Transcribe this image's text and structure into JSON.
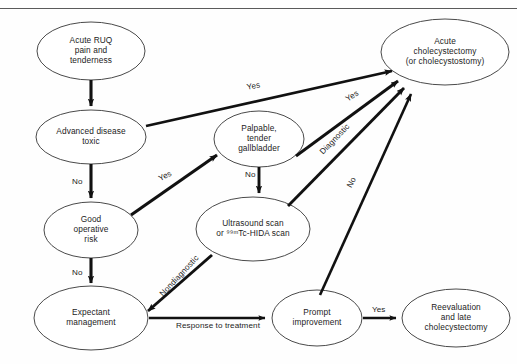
{
  "figure": {
    "type": "flowchart",
    "background_color": "#fefefe",
    "node_stroke_color": "#4a4a4a",
    "arrow_color": "#111111",
    "text_color": "#1c1c1c"
  },
  "nodes": [
    {
      "id": "acute-ruq",
      "name": "acute-ruq-pain-node",
      "lines": [
        "Acute RUQ",
        "pain and",
        "tenderness"
      ],
      "cx": 91,
      "cy": 51,
      "rx": 54,
      "ry": 29
    },
    {
      "id": "advanced-disease",
      "name": "advanced-disease-node",
      "lines": [
        "Advanced disease",
        "toxic"
      ],
      "cx": 91,
      "cy": 137,
      "rx": 55,
      "ry": 27
    },
    {
      "id": "good-operative-risk",
      "name": "good-operative-risk-node",
      "lines": [
        "Good",
        "operative",
        "risk"
      ],
      "cx": 91,
      "cy": 230,
      "rx": 47,
      "ry": 28
    },
    {
      "id": "expectant-management",
      "name": "expectant-management-node",
      "lines": [
        "Expectant",
        "management"
      ],
      "cx": 91,
      "cy": 318,
      "rx": 57,
      "ry": 32
    },
    {
      "id": "palpable-gallbladder",
      "name": "palpable-tender-gallbladder-node",
      "lines": [
        "Palpable,",
        "tender",
        "gallbladder"
      ],
      "cx": 259,
      "cy": 139,
      "rx": 45,
      "ry": 28
    },
    {
      "id": "ultrasound-scan",
      "name": "ultrasound-scan-node",
      "lines": [
        "Ultrasound scan",
        "or ⁹⁹ᵐTc-HIDA scan"
      ],
      "cx": 253,
      "cy": 229,
      "rx": 57,
      "ry": 32
    },
    {
      "id": "prompt-improvement",
      "name": "prompt-improvement-node",
      "lines": [
        "Prompt",
        "improvement"
      ],
      "cx": 317,
      "cy": 318,
      "rx": 45,
      "ry": 28
    },
    {
      "id": "acute-cholecystectomy",
      "name": "acute-cholecystectomy-node",
      "lines": [
        "Acute",
        "cholecystectomy",
        "(or cholecystostomy)"
      ],
      "cx": 445,
      "cy": 52,
      "rx": 64,
      "ry": 33
    },
    {
      "id": "reevaluation-late",
      "name": "reevaluation-late-cholecystectomy-node",
      "lines": [
        "Reevaluation",
        "and late",
        "cholecystectomy"
      ],
      "cx": 456,
      "cy": 318,
      "rx": 54,
      "ry": 29
    }
  ],
  "edges": [
    {
      "id": "e1",
      "name": "edge-acute-ruq-to-advanced-disease",
      "from": "acute-ruq",
      "to": "advanced-disease",
      "label": "",
      "weight": "thick"
    },
    {
      "id": "e2",
      "name": "edge-advanced-disease-yes-to-cholecystectomy",
      "from": "advanced-disease",
      "to": "acute-cholecystectomy",
      "label": "Yes",
      "label_x": 246,
      "label_y": 83,
      "label_rot": -11,
      "weight": "thick"
    },
    {
      "id": "e3",
      "name": "edge-advanced-disease-no-to-good-risk",
      "from": "advanced-disease",
      "to": "good-operative-risk",
      "label": "No",
      "label_x": 72,
      "label_y": 177,
      "label_rot": 0,
      "weight": "thick"
    },
    {
      "id": "e4",
      "name": "edge-good-risk-yes-to-palpable",
      "from": "good-operative-risk",
      "to": "palpable-gallbladder",
      "label": "Yes",
      "label_x": 157,
      "label_y": 175,
      "label_rot": -27,
      "weight": "thick"
    },
    {
      "id": "e5",
      "name": "edge-good-risk-no-to-expectant",
      "from": "good-operative-risk",
      "to": "expectant-management",
      "label": "No",
      "label_x": 72,
      "label_y": 268,
      "label_rot": 0,
      "weight": "thick"
    },
    {
      "id": "e6",
      "name": "edge-palpable-yes-to-cholecystectomy",
      "from": "palpable-gallbladder",
      "to": "acute-cholecystectomy",
      "label": "Yes",
      "label_x": 344,
      "label_y": 96,
      "label_rot": -33,
      "weight": "thick"
    },
    {
      "id": "e7",
      "name": "edge-palpable-no-to-ultrasound",
      "from": "palpable-gallbladder",
      "to": "ultrasound-scan",
      "label": "No",
      "label_x": 245,
      "label_y": 170,
      "label_rot": 0,
      "weight": "thick"
    },
    {
      "id": "e8",
      "name": "edge-ultrasound-diagnostic-to-cholecystectomy",
      "from": "ultrasound-scan",
      "to": "acute-cholecystectomy",
      "label": "Diagnostic",
      "label_x": 318,
      "label_y": 150,
      "label_rot": -46,
      "weight": "thick"
    },
    {
      "id": "e9",
      "name": "edge-ultrasound-nondiagnostic-to-expectant",
      "from": "ultrasound-scan",
      "to": "expectant-management",
      "label": "Nondiagnostic",
      "label_x": 158,
      "label_y": 292,
      "label_rot": -47,
      "weight": "thick"
    },
    {
      "id": "e10",
      "name": "edge-expectant-response-to-prompt-improvement",
      "from": "expectant-management",
      "to": "prompt-improvement",
      "label": "Response\nto treatment",
      "label_x": 209,
      "label_y": 322,
      "label_rot": 0,
      "weight": "medium"
    },
    {
      "id": "e11",
      "name": "edge-prompt-improvement-no-to-cholecystectomy",
      "from": "prompt-improvement",
      "to": "acute-cholecystectomy",
      "label": "No",
      "label_x": 345,
      "label_y": 185,
      "label_rot": -62,
      "weight": "thick"
    },
    {
      "id": "e12",
      "name": "edge-prompt-improvement-yes-to-reevaluation",
      "from": "prompt-improvement",
      "to": "reevaluation-late",
      "label": "Yes",
      "label_x": 384,
      "label_y": 305,
      "label_rot": 0,
      "weight": "medium"
    }
  ],
  "edge_label_text": {
    "yes_1": "Yes",
    "no_1": "No",
    "yes_2": "Yes",
    "no_2": "No",
    "yes_3": "Yes",
    "no_3": "No",
    "diagnostic": "Diagnostic",
    "nondiagnostic": "Nondiagnostic",
    "response_line1": "Response",
    "response_line2": "to treatment",
    "yes_4": "Yes"
  }
}
